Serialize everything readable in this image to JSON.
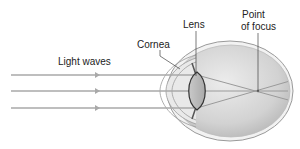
{
  "diagram": {
    "labels": {
      "light_waves": "Light waves",
      "cornea": "Cornea",
      "lens": "Lens",
      "point_of_focus_line1": "Point",
      "point_of_focus_line2": "of focus"
    },
    "colors": {
      "ray": "#a9a9a9",
      "eyeball_fill": "#d6d6d6",
      "eyeball_outline": "#9a9a9a",
      "lens_fill": "#bdbdbd",
      "lens_outline": "#333333",
      "label_text": "#222222",
      "leader_line": "#444444"
    },
    "ray_count": 3
  }
}
